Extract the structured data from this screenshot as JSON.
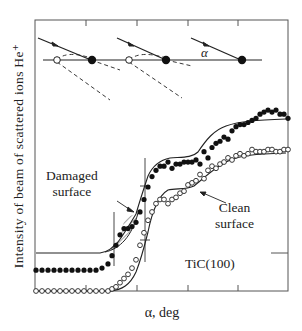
{
  "chart_data": {
    "type": "scatter",
    "title": "",
    "xlabel": "α, deg",
    "ylabel": "Intensity of beam of scattered ions He⁺",
    "sample_label": "TiC(100)",
    "grid": false,
    "axis_ticks_unlabeled": true,
    "x_ticks_px": [
      86,
      137,
      188,
      238
    ],
    "inset_schematic": {
      "description": "Three incident ion trajectories at glancing angle α hitting surface atoms; open circles = vacancies/defects, filled circles = surface atoms; dashed lines = scattered trajectories",
      "angle_label": "α"
    },
    "annotations": [
      {
        "text": "Damaged\nsurface",
        "target": "filled-series shoulder (hatched region)"
      },
      {
        "text": "Clean\nsurface",
        "target": "open-series plateau"
      }
    ],
    "series": [
      {
        "name": "Damaged surface",
        "marker": "filled-circle",
        "x": [
          36,
          42,
          48,
          54,
          60,
          66,
          72,
          78,
          84,
          90,
          96,
          102,
          108,
          112,
          116,
          120,
          124,
          128,
          132,
          136,
          140,
          144,
          148,
          152,
          156,
          160,
          164,
          168,
          172,
          176,
          180,
          184,
          188,
          192,
          196,
          200,
          204,
          208,
          212,
          216,
          220,
          224,
          228,
          232,
          236,
          240,
          244,
          248,
          252,
          256,
          260,
          264,
          268,
          272,
          276,
          280,
          284,
          288
        ],
        "y_norm": [
          0.1,
          0.1,
          0.1,
          0.1,
          0.1,
          0.1,
          0.1,
          0.1,
          0.1,
          0.1,
          0.1,
          0.11,
          0.13,
          0.17,
          0.22,
          0.27,
          0.3,
          0.3,
          0.31,
          0.33,
          0.38,
          0.44,
          0.5,
          0.55,
          0.58,
          0.6,
          0.6,
          0.62,
          0.59,
          0.61,
          0.61,
          0.62,
          0.62,
          0.62,
          0.63,
          0.61,
          0.67,
          0.64,
          0.69,
          0.71,
          0.72,
          0.74,
          0.73,
          0.77,
          0.79,
          0.8,
          0.8,
          0.81,
          0.82,
          0.83,
          0.85,
          0.86,
          0.87,
          0.86,
          0.87,
          0.85,
          0.85,
          0.83
        ]
      },
      {
        "name": "Clean surface",
        "marker": "open-circle",
        "x": [
          36,
          42,
          48,
          54,
          60,
          66,
          72,
          78,
          84,
          90,
          96,
          102,
          108,
          112,
          116,
          120,
          124,
          128,
          132,
          136,
          140,
          144,
          148,
          152,
          156,
          160,
          164,
          168,
          172,
          176,
          180,
          184,
          188,
          192,
          196,
          200,
          204,
          208,
          212,
          216,
          220,
          224,
          228,
          232,
          236,
          240,
          244,
          248,
          252,
          256,
          260,
          264,
          268,
          272,
          276,
          280,
          284,
          288
        ],
        "y_norm": [
          0.0,
          0.0,
          0.0,
          0.0,
          0.0,
          0.0,
          0.0,
          0.0,
          0.0,
          0.0,
          0.0,
          0.0,
          0.0,
          0.01,
          0.02,
          0.04,
          0.06,
          0.08,
          0.11,
          0.15,
          0.22,
          0.28,
          0.34,
          0.38,
          0.42,
          0.44,
          0.44,
          0.42,
          0.44,
          0.45,
          0.47,
          0.48,
          0.51,
          0.52,
          0.53,
          0.56,
          0.54,
          0.58,
          0.6,
          0.59,
          0.61,
          0.62,
          0.64,
          0.63,
          0.65,
          0.66,
          0.65,
          0.66,
          0.68,
          0.67,
          0.67,
          0.67,
          0.68,
          0.68,
          0.67,
          0.67,
          0.68,
          0.68
        ]
      }
    ],
    "plot_frame_px": {
      "left": 35,
      "top": 20,
      "right": 288,
      "bottom": 291
    }
  }
}
